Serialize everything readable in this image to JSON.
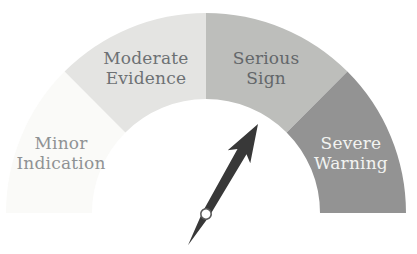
{
  "chart_data": {
    "type": "gauge",
    "title": "",
    "arc_span_deg": 180,
    "segment_arc_deg": 45,
    "background": "#ffffff",
    "segments": [
      {
        "label": "Minor Indication",
        "color": "#fafaf8",
        "text_color": "#8f9294"
      },
      {
        "label": "Moderate Evidence",
        "color": "#e4e4e2",
        "text_color": "#6d7174"
      },
      {
        "label": "Serious Sign",
        "color": "#bdbebb",
        "text_color": "#63676a"
      },
      {
        "label": "Severe Warning",
        "color": "#939393",
        "text_color": "#f2f3f1"
      }
    ],
    "needle": {
      "angle_deg_from_top": 30,
      "points_to": "Serious Sign",
      "color": "#383838",
      "pivot_fill": "#ffffff",
      "pivot_stroke": "#5a5a5a"
    }
  }
}
